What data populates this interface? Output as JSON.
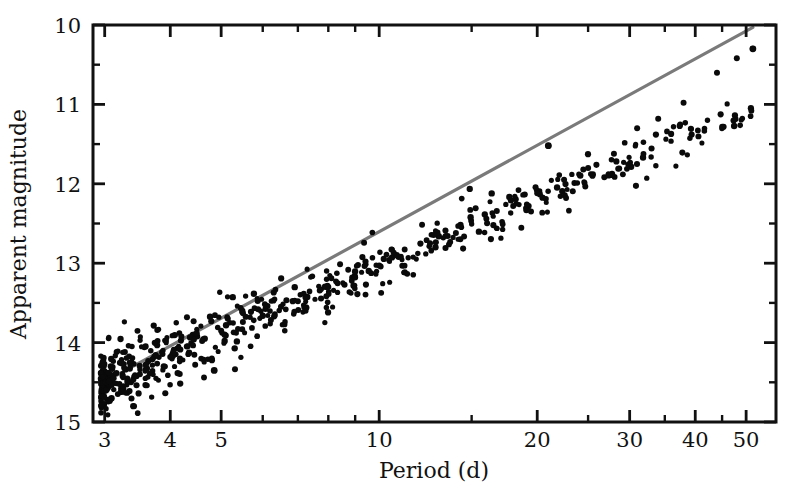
{
  "figure": {
    "background_color": "#ffffff",
    "point_color": "#0a0a0a",
    "line_color": "#7a7a7a",
    "axis_color": "#111111"
  },
  "chart_data": {
    "type": "scatter",
    "title": "",
    "xlabel": "Period (d)",
    "ylabel": "Apparent magnitude",
    "xscale": "log",
    "yscale": "linear",
    "y_inverted": true,
    "xlim": [
      2.85,
      57.0
    ],
    "ylim": [
      10,
      15
    ],
    "grid": false,
    "legend": null,
    "x_major_ticks": [
      3,
      4,
      5,
      10,
      20,
      30,
      40,
      50
    ],
    "x_major_tick_labels": [
      "3",
      "4",
      "5",
      "10",
      "20",
      "30",
      "40",
      "50"
    ],
    "x_minor_ticks": [
      6,
      7,
      8,
      9,
      15,
      25,
      35,
      45
    ],
    "y_major_ticks": [
      10,
      11,
      12,
      13,
      14,
      15
    ],
    "y_major_tick_labels": [
      "10",
      "11",
      "12",
      "13",
      "14",
      "15"
    ],
    "y_minor_ticks": [
      10.5,
      11.5,
      12.5,
      13.5,
      14.5
    ],
    "fit": {
      "name": "period-luminosity relation",
      "type": "line",
      "slope_mag_per_dex": -2.81,
      "intercept_mag_at_1d": 15.84,
      "x_start": 2.95,
      "x_end": 51.5,
      "y_start": 14.52,
      "y_end": 10.03,
      "color": "#7a7a7a"
    },
    "series": [
      {
        "name": "Cepheid variables",
        "marker": "filled-circle",
        "marker_size_px": 5,
        "color": "#0a0a0a",
        "n_points": 612,
        "scatter_sigma_mag": 0.17,
        "x_distribution": "log-uniform-weighted-to-short-periods",
        "sample_points": [
          [
            3.02,
            14.6
          ],
          [
            3.05,
            14.38
          ],
          [
            3.08,
            14.71
          ],
          [
            3.12,
            14.45
          ],
          [
            3.2,
            14.52
          ],
          [
            3.35,
            14.33
          ],
          [
            3.5,
            14.4
          ],
          [
            3.7,
            14.21
          ],
          [
            4.0,
            14.18
          ],
          [
            4.3,
            14.05
          ],
          [
            4.6,
            13.98
          ],
          [
            5.0,
            13.85
          ],
          [
            5.5,
            13.74
          ],
          [
            6.0,
            13.66
          ],
          [
            6.5,
            13.55
          ],
          [
            7.0,
            13.48
          ],
          [
            8.0,
            13.3
          ],
          [
            9.0,
            13.18
          ],
          [
            10.0,
            13.03
          ],
          [
            11.0,
            12.92
          ],
          [
            12.5,
            12.75
          ],
          [
            14.0,
            12.62
          ],
          [
            16.0,
            12.44
          ],
          [
            18.0,
            12.28
          ],
          [
            20.0,
            12.12
          ],
          [
            21.0,
            11.52
          ],
          [
            22.5,
            11.95
          ],
          [
            25.0,
            11.8
          ],
          [
            28.0,
            11.62
          ],
          [
            31.0,
            11.3
          ],
          [
            34.0,
            11.18
          ],
          [
            38.0,
            10.98
          ],
          [
            44.0,
            10.6
          ],
          [
            48.0,
            10.42
          ],
          [
            51.5,
            10.3
          ]
        ],
        "outliers": [
          {
            "x": 51.5,
            "y": 10.3,
            "note": "bright point above fit at right edge"
          },
          {
            "x": 21.0,
            "y": 11.52,
            "note": "bright point above fit"
          },
          {
            "x": 4.85,
            "y": 14.35,
            "note": "faint point below main band"
          }
        ]
      }
    ]
  }
}
